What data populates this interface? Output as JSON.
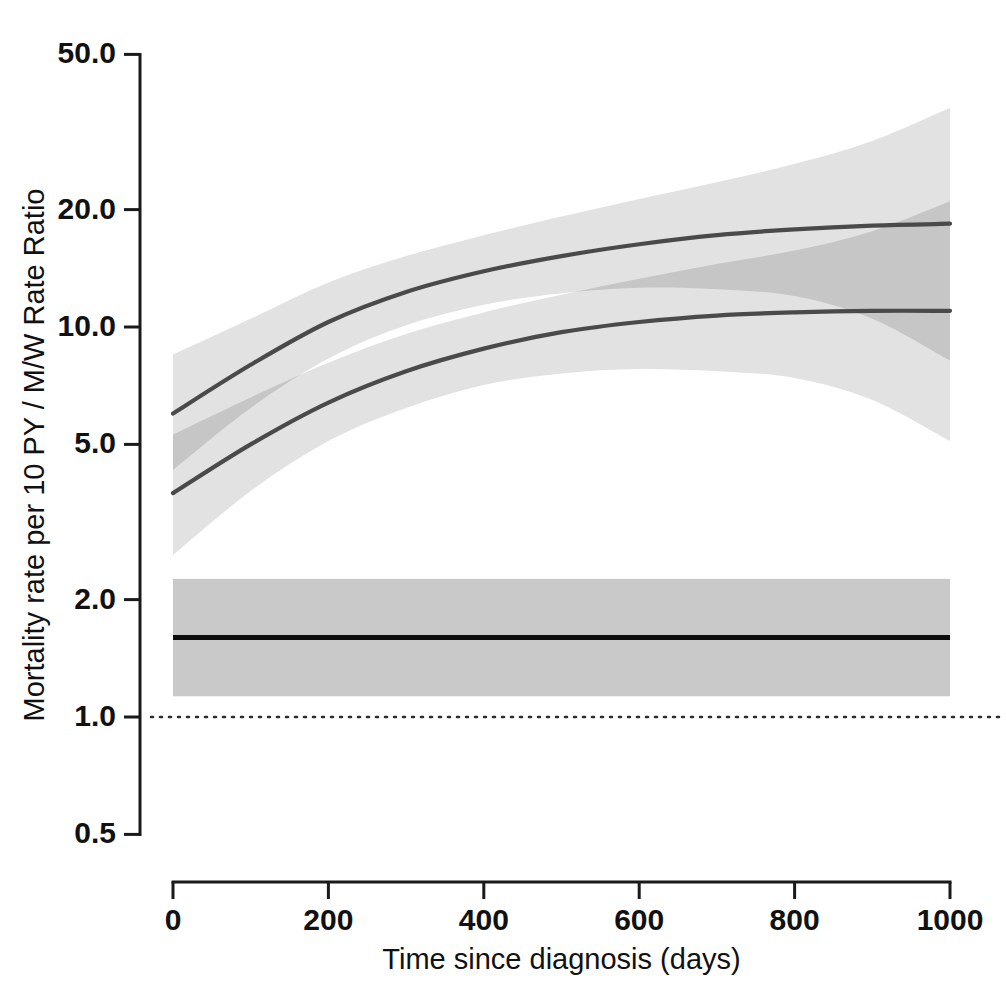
{
  "chart_data": {
    "type": "line",
    "title": "",
    "xlabel": "Time since diagnosis (days)",
    "ylabel": "Mortality rate per 10 PY / M/W Rate Ratio",
    "xlim": [
      0,
      1000
    ],
    "ylim": [
      0.5,
      50.0
    ],
    "yscale": "log",
    "grid": false,
    "legend": "none",
    "xticks": [
      0,
      200,
      400,
      600,
      800,
      1000
    ],
    "xtick_labels": [
      "0",
      "200",
      "400",
      "600",
      "800",
      "1000"
    ],
    "yticks": [
      0.5,
      1.0,
      2.0,
      5.0,
      10.0,
      20.0,
      50.0
    ],
    "ytick_labels": [
      "0.5",
      "1.0",
      "2.0",
      "5.0",
      "10.0",
      "20.0",
      "50.0"
    ],
    "reference_line": {
      "y": 1.0,
      "style": "dotted",
      "color": "#2b2b2b"
    },
    "x": [
      0,
      100,
      200,
      300,
      400,
      500,
      600,
      700,
      800,
      900,
      1000
    ],
    "series": [
      {
        "name": "Men mortality rate per 10 PY",
        "color": "#4a4a4a",
        "values": [
          6.0,
          8.0,
          10.3,
          12.3,
          13.9,
          15.2,
          16.3,
          17.2,
          17.8,
          18.2,
          18.4
        ],
        "band_lower": [
          4.3,
          6.2,
          8.3,
          10.1,
          11.4,
          12.2,
          12.6,
          12.5,
          12.0,
          10.5,
          8.2
        ],
        "band_upper": [
          8.5,
          10.5,
          13.0,
          15.2,
          17.2,
          19.2,
          21.3,
          23.5,
          26.2,
          30.0,
          36.5
        ],
        "band_color": "#e2e2e2"
      },
      {
        "name": "Women mortality rate per 10 PY",
        "color": "#4a4a4a",
        "values": [
          3.75,
          5.0,
          6.4,
          7.7,
          8.8,
          9.7,
          10.3,
          10.7,
          10.9,
          11.0,
          11.0
        ],
        "band_lower": [
          2.6,
          3.8,
          5.1,
          6.2,
          7.1,
          7.6,
          7.8,
          7.7,
          7.4,
          6.5,
          5.1
        ],
        "band_upper": [
          5.3,
          6.6,
          8.1,
          9.6,
          10.9,
          12.1,
          13.3,
          14.5,
          15.7,
          17.6,
          21.0
        ],
        "band_color": "#e2e2e2"
      },
      {
        "name": "M/W Rate Ratio",
        "color": "#0d0d0d",
        "values": [
          1.6,
          1.6,
          1.6,
          1.6,
          1.6,
          1.6,
          1.6,
          1.6,
          1.6,
          1.6,
          1.6
        ],
        "band_lower": [
          1.13,
          1.13,
          1.13,
          1.13,
          1.13,
          1.13,
          1.13,
          1.13,
          1.13,
          1.13,
          1.13
        ],
        "band_upper": [
          2.26,
          2.26,
          2.26,
          2.26,
          2.26,
          2.26,
          2.26,
          2.26,
          2.26,
          2.26,
          2.26
        ],
        "band_color": "#c9c9c9"
      }
    ],
    "overlap_band_color": "#c6c6c6"
  },
  "axes": {
    "x_title": "Time since diagnosis (days)",
    "y_title": "Mortality rate per 10 PY / M/W Rate Ratio"
  }
}
